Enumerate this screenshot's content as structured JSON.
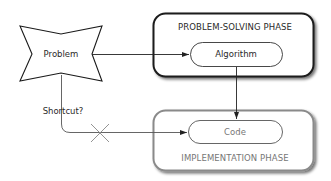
{
  "diagram": {
    "nodes": {
      "problem": {
        "label": "Problem",
        "shape": "four-point-star"
      },
      "problem_solving_phase": {
        "label": "PROBLEM-SOLVING PHASE",
        "border_color": "#1a1a1a"
      },
      "algorithm": {
        "label": "Algorithm",
        "shape": "pill"
      },
      "implementation_phase": {
        "label": "IMPLEMENTATION PHASE",
        "border_color": "#8a8a8a"
      },
      "code": {
        "label": "Code",
        "shape": "pill"
      }
    },
    "edges": [
      {
        "from": "Problem",
        "to": "Algorithm"
      },
      {
        "from": "Algorithm",
        "to": "Code"
      },
      {
        "from": "Problem",
        "to": "Code",
        "label": "Shortcut?",
        "blocked": true
      }
    ],
    "shortcut_label": "Shortcut?",
    "blocked_marker": "x-mark"
  }
}
